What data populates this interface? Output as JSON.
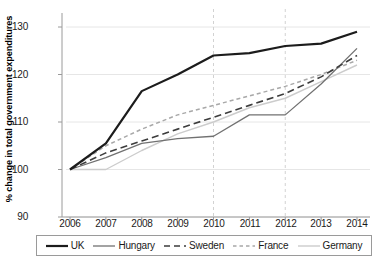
{
  "chart_data": {
    "type": "line",
    "title": "",
    "xlabel": "",
    "ylabel": "% change in total government expenditures",
    "categories": [
      "2006",
      "2007",
      "2008",
      "2009",
      "2010",
      "2011",
      "2012",
      "2013",
      "2014"
    ],
    "x": [
      2006,
      2007,
      2008,
      2009,
      2010,
      2011,
      2012,
      2013,
      2014
    ],
    "xlim": [
      2005.6,
      2014.4
    ],
    "ylim": [
      88,
      132
    ],
    "yticks": [
      90,
      100,
      110,
      120,
      130
    ],
    "ytick_labels": [
      "90",
      "100",
      "110",
      "120",
      "130"
    ],
    "grid": "horizontal-light",
    "legend_position": "below-plot",
    "vlines": [
      2010,
      2012
    ],
    "series": [
      {
        "name": "UK",
        "values": [
          100,
          105.5,
          116.5,
          120,
          124,
          124.5,
          126,
          126.5,
          129
        ],
        "color": "#1c1c1c",
        "style": "solid",
        "width": 2.2
      },
      {
        "name": "Hungary",
        "values": [
          100,
          102.5,
          105.5,
          106.5,
          107,
          111.5,
          111.5,
          118,
          125.5
        ],
        "color": "#717171",
        "style": "solid",
        "width": 1.3
      },
      {
        "name": "Sweden",
        "values": [
          100,
          103.5,
          106,
          108.5,
          111,
          113.5,
          116,
          119.5,
          124
        ],
        "color": "#3d3d3d",
        "style": "dashed",
        "width": 1.6
      },
      {
        "name": "France",
        "values": [
          100,
          105,
          108.5,
          111.5,
          113.5,
          115.5,
          117.5,
          120,
          123
        ],
        "color": "#a8a8a8",
        "style": "finedash",
        "width": 1.5
      },
      {
        "name": "Germany",
        "values": [
          100,
          100,
          104,
          107.5,
          110,
          113,
          115,
          118.5,
          122
        ],
        "color": "#cccccc",
        "style": "solid",
        "width": 1.4
      }
    ]
  },
  "axis": {
    "y_tick_0": "130",
    "y_tick_1": "120",
    "y_tick_2": "110",
    "y_tick_3": "100",
    "y_tick_4": "90",
    "x_tick_0": "2006",
    "x_tick_1": "2007",
    "x_tick_2": "2008",
    "x_tick_3": "2009",
    "x_tick_4": "2010",
    "x_tick_5": "2011",
    "x_tick_6": "2012",
    "x_tick_7": "2013",
    "x_tick_8": "2014",
    "y_axis_title": "% change in total government expenditures"
  },
  "legend": {
    "items": [
      {
        "label": "UK",
        "swatch": "solid-thick-black-line-icon"
      },
      {
        "label": "Hungary",
        "swatch": "solid-gray-line-icon"
      },
      {
        "label": "Sweden",
        "swatch": "dashed-dark-line-icon"
      },
      {
        "label": "France",
        "swatch": "fine-dashed-light-line-icon"
      },
      {
        "label": "Germany",
        "swatch": "solid-light-gray-line-icon"
      }
    ]
  },
  "colors": {
    "uk": "#1c1c1c",
    "hungary": "#717171",
    "sweden": "#3d3d3d",
    "france": "#a8a8a8",
    "germany": "#cccccc",
    "grid": "#e6e6e6",
    "axis": "#9a9a9a",
    "vline": "#d2d2d2"
  }
}
